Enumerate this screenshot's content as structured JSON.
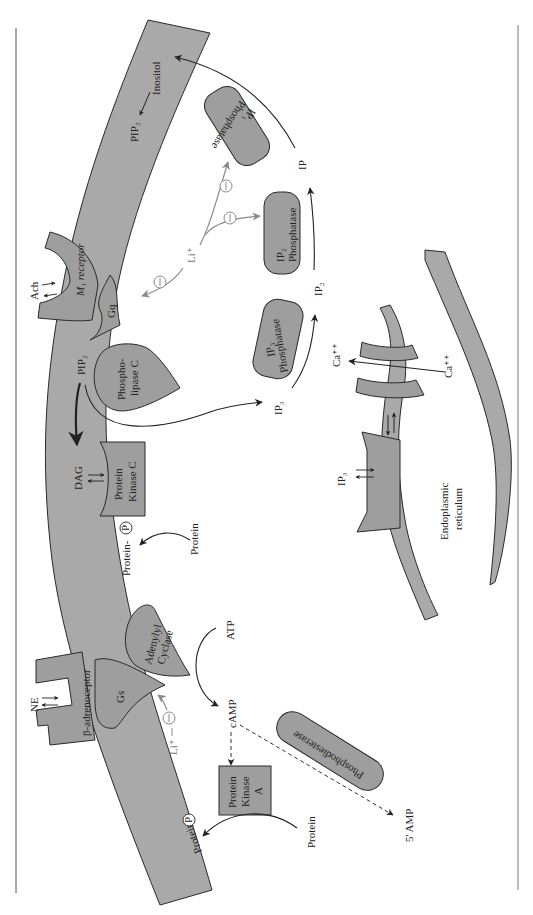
{
  "diagram": {
    "type": "signal-transduction-pathway",
    "orientation": "rotated 90° clockwise",
    "colors": {
      "membrane_fill": "#a9a9a9",
      "protein_fill": "#9e9e9e",
      "outline": "#2a2a2a",
      "lithium_inhibition": "#8a8a8a",
      "background": "#ffffff"
    },
    "labels": {
      "ne": "NE",
      "beta_receptor": "β-adrenoceptor",
      "gs": "Gs",
      "adenylyl_cyclase_1": "Adenylyl",
      "adenylyl_cyclase_2": "Cyclase",
      "atp": "ATP",
      "camp": "cAMP",
      "li_gs": "Li⁺",
      "pka_1": "Protein",
      "pka_2": "Kinase",
      "pka_3": "A",
      "protein_pka": "Protein",
      "protein_p_pka": "Protein-",
      "p_symbol": "P",
      "phosphodiesterase": "Phosphodiesterase",
      "five_amp": "5' AMP",
      "ach": "Ach",
      "m1_receptor": "M₁ receptor",
      "gq": "Gq",
      "pip2": "PIP₂",
      "plc_1": "Phospho-",
      "plc_2": "lipase C",
      "dag": "DAG",
      "pkc_1": "Protein",
      "pkc_2": "Kinase C",
      "protein_pkc": "Protein",
      "protein_p_pkc": "Protein-",
      "ip3": "IP₃",
      "ip3_phosphatase_1": "IP₃",
      "ip3_phosphatase_2": "Phosphatase",
      "ip2": "IP₂",
      "ip2_phosphatase_1": "IP₂",
      "ip2_phosphatase_2": "Phosphatase",
      "ip": "IP",
      "ip1_phosphatase_1": "IP₁",
      "ip1_phosphatase_2": "Phosphatase",
      "inositol": "Inositol",
      "pip2_membrane": "PIP₂",
      "li_ip": "Li⁺",
      "inhibit_symbol": "−",
      "ca_in": "Ca⁺⁺",
      "ca_out": "Ca⁺⁺",
      "ip3_receptor_label": "IP₃",
      "er_1": "Endoplasmic",
      "er_2": "reticulum"
    }
  }
}
